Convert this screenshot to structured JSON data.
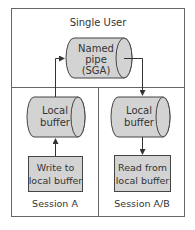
{
  "diagram": {
    "title": "Single User",
    "named_pipe": {
      "line1": "Named",
      "line2": "pipe",
      "line3": "(SGA)"
    },
    "left_session": {
      "buffer": {
        "line1": "Local",
        "line2": "buffer"
      },
      "action": {
        "line1": "Write to",
        "line2": "local buffer"
      },
      "label": "Session A"
    },
    "right_session": {
      "buffer": {
        "line1": "Local",
        "line2": "buffer"
      },
      "action": {
        "line1": "Read from",
        "line2": "local buffer"
      },
      "label": "Session A/B"
    },
    "colors": {
      "fill": "#d3d3d3",
      "stroke": "#444444",
      "frame": "#666666",
      "text": "#333333"
    }
  }
}
